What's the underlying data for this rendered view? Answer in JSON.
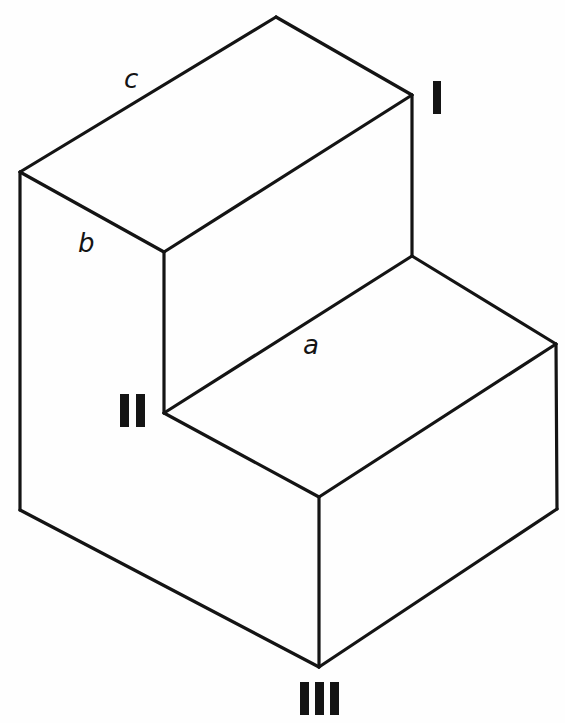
{
  "figure": {
    "edge_labels": {
      "a": "a",
      "b": "b",
      "c": "c"
    },
    "vertex_labels": {
      "I": "I",
      "II": "II",
      "III": "III"
    },
    "colors": {
      "line": "#141414",
      "background": "#fefefe"
    }
  }
}
